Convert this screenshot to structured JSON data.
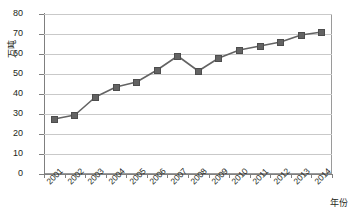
{
  "chart_data": {
    "type": "line",
    "title": "",
    "xlabel": "年份",
    "ylabel": "万吨",
    "categories": [
      "2001",
      "2002",
      "2003",
      "2004",
      "2005",
      "2006",
      "2007",
      "2008",
      "2009",
      "2010",
      "2011",
      "2012",
      "2013",
      "2014"
    ],
    "values": [
      27.5,
      29.5,
      38.5,
      43.5,
      46,
      52,
      59,
      51.5,
      58,
      62,
      64,
      66,
      69.5,
      71
    ],
    "series": [
      {
        "name": "",
        "values": [
          27.5,
          29.5,
          38.5,
          43.5,
          46,
          52,
          59,
          51.5,
          58,
          62,
          64,
          66,
          69.5,
          71
        ]
      }
    ],
    "ylim": [
      0,
      80
    ],
    "ytick_labels": [
      "0",
      "10",
      "20",
      "30",
      "40",
      "50",
      "60",
      "70",
      "80"
    ],
    "ytick_values": [
      0,
      10,
      20,
      30,
      40,
      50,
      60,
      70,
      80
    ],
    "grid": true,
    "legend": "none",
    "marker": "square",
    "line_color": "#636363",
    "marker_color": "#636363",
    "grid_color": "#c9c9c9",
    "axis_color": "#7f7f7f",
    "background_color": "#ffffff"
  }
}
